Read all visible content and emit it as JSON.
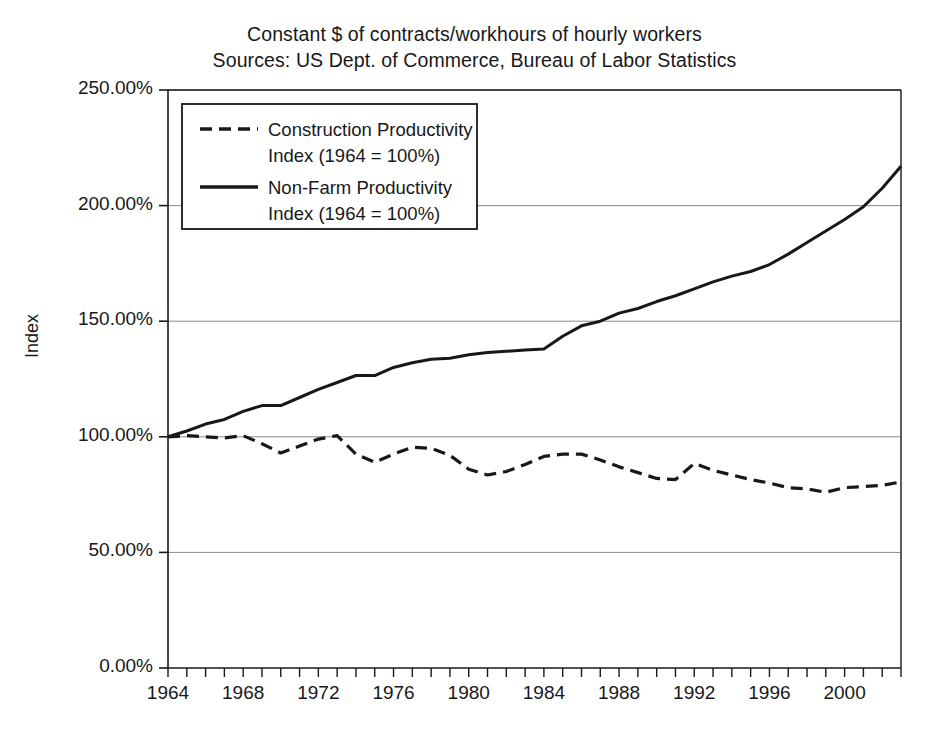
{
  "chart_data": {
    "type": "line",
    "title": "Constant $ of contracts/workhours of hourly workers",
    "subtitle": "Sources: US Dept. of Commerce, Bureau of Labor Statistics",
    "title_lines": [
      "Constant $ of contracts/workhours of hourly workers",
      "Sources: US Dept. of Commerce, Bureau of Labor Statistics"
    ],
    "xlabel": "",
    "ylabel": "Index",
    "ylim": [
      0,
      250
    ],
    "xlim": [
      1964,
      2003
    ],
    "grid": true,
    "gridlines": "horizontal",
    "legend_position": "upper-left-inside",
    "y_tick_labels": [
      "250.00%",
      "200.00%",
      "150.00%",
      "100.00%",
      "50.00%",
      "0.00%"
    ],
    "y_tick_values": [
      250,
      200,
      150,
      100,
      50,
      0
    ],
    "x_tick_labels": [
      "1964",
      "1968",
      "1972",
      "1976",
      "1980",
      "1984",
      "1988",
      "1992",
      "1996",
      "2000"
    ],
    "x_tick_values": [
      1964,
      1968,
      1972,
      1976,
      1980,
      1984,
      1988,
      1992,
      1996,
      2000
    ],
    "x_minor_tick_step": 1,
    "units": "percent",
    "colors": {
      "ink": "#17181a",
      "grid": "#8a8a8a",
      "background": "#ffffff"
    },
    "x": [
      1964,
      1965,
      1966,
      1967,
      1968,
      1969,
      1970,
      1971,
      1972,
      1973,
      1974,
      1975,
      1976,
      1977,
      1978,
      1979,
      1980,
      1981,
      1982,
      1983,
      1984,
      1985,
      1986,
      1987,
      1988,
      1989,
      1990,
      1991,
      1992,
      1993,
      1994,
      1995,
      1996,
      1997,
      1998,
      1999,
      2000,
      2001,
      2002,
      2003
    ],
    "series": [
      {
        "name": "Construction Productivity Index (1964 = 100%)",
        "label_lines": [
          "Construction Productivity",
          "Index (1964 = 100%)"
        ],
        "style": "dashed",
        "color": "#17181a",
        "values": [
          100,
          100.5,
          100,
          99.5,
          100.5,
          97,
          93,
          96,
          99,
          100.5,
          92.5,
          89,
          92.5,
          95.5,
          95,
          92,
          86,
          83.5,
          85,
          88,
          91.5,
          92.5,
          92.5,
          90,
          87,
          84.5,
          82,
          81.5,
          88.5,
          85.5,
          83.5,
          81.5,
          80,
          78,
          77.5,
          76,
          78,
          78.5,
          79,
          80.5
        ]
      },
      {
        "name": "Non-Farm Productivity Index (1964 = 100%)",
        "label_lines": [
          "Non-Farm Productivity",
          "Index (1964 = 100%)"
        ],
        "style": "solid",
        "color": "#17181a",
        "values": [
          100,
          102.5,
          105.5,
          107.5,
          111,
          113.5,
          113.5,
          117,
          120.5,
          123.5,
          126.5,
          126.5,
          130,
          132,
          133.5,
          134,
          135.5,
          136.5,
          137,
          137.5,
          138,
          143.5,
          148,
          150,
          153.5,
          155.5,
          158.5,
          161,
          164,
          167,
          169.5,
          171.5,
          174.5,
          179,
          184,
          189,
          194,
          199.5,
          207.5,
          217
        ]
      }
    ]
  }
}
